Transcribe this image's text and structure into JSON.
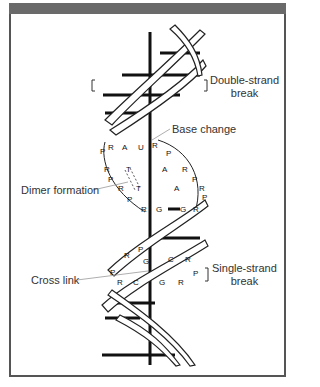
{
  "figure": {
    "title_bar_color": "#6a6a6a",
    "labels": {
      "double_strand_break_1": "Double-strand",
      "double_strand_break_2": "break",
      "base_change": "Base change",
      "dimer_formation": "Dimer formation",
      "cross_link": "Cross link",
      "single_strand_break_1": "Single-strand",
      "single_strand_break_2": "break"
    },
    "bases": {
      "left_strand_top": [
        "P",
        "R",
        "A"
      ],
      "base_change_pair": [
        "U",
        "R"
      ],
      "dimer": [
        "T",
        "T"
      ],
      "right_strand": [
        "P",
        "A",
        "R",
        "P",
        "A",
        "R",
        "P"
      ],
      "gc_pair": [
        "R",
        "G",
        "G",
        "R"
      ],
      "cross_link_region": [
        "P",
        "R",
        "P",
        "G",
        "C",
        "R",
        "P",
        "R",
        "C",
        "G",
        "R"
      ]
    }
  }
}
